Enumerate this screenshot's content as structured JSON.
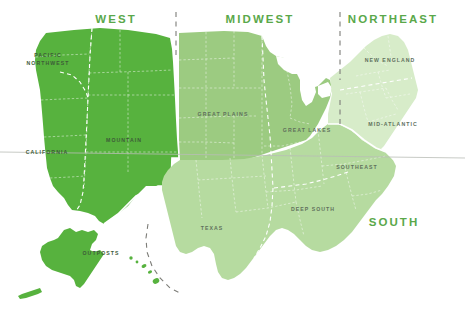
{
  "map": {
    "title_visible": false,
    "background_color": "#ffffff",
    "horizon_line_color": "#b9bcb6",
    "region_titles": [
      {
        "id": "west",
        "label": "WEST",
        "x": 116,
        "y": 23,
        "color": "#5aa84a"
      },
      {
        "id": "midwest",
        "label": "MIDWEST",
        "x": 260,
        "y": 23,
        "color": "#69b053"
      },
      {
        "id": "northeast",
        "label": "NORTHEAST",
        "x": 393,
        "y": 23,
        "color": "#7cbd63"
      },
      {
        "id": "south",
        "label": "SOUTH",
        "x": 394,
        "y": 226,
        "color": "#7cbd63"
      }
    ],
    "subregions": [
      {
        "id": "pacific-northwest",
        "label": "PACIFIC",
        "label2": "NORTHWEST",
        "x": 48,
        "y": 57,
        "tone": "dark"
      },
      {
        "id": "california",
        "label": "CALIFORNIA",
        "x": 47,
        "y": 154,
        "tone": "dark"
      },
      {
        "id": "mountain",
        "label": "MOUNTAIN",
        "x": 124,
        "y": 142,
        "tone": "dark"
      },
      {
        "id": "great-plains",
        "label": "GREAT PLAINS",
        "x": 223,
        "y": 116,
        "tone": "mid"
      },
      {
        "id": "great-lakes",
        "label": "GREAT LAKES",
        "x": 307,
        "y": 132,
        "tone": "mid"
      },
      {
        "id": "new-england",
        "label": "NEW ENGLAND",
        "x": 390,
        "y": 62,
        "tone": "light"
      },
      {
        "id": "mid-atlantic",
        "label": "MID-ATLANTIC",
        "x": 393,
        "y": 126,
        "tone": "light"
      },
      {
        "id": "southeast",
        "label": "SOUTHEAST",
        "x": 357,
        "y": 169,
        "tone": "light"
      },
      {
        "id": "deep-south",
        "label": "DEEP SOUTH",
        "x": 313,
        "y": 211,
        "tone": "mid"
      },
      {
        "id": "texas",
        "label": "TEXAS",
        "x": 212,
        "y": 230,
        "tone": "mid"
      },
      {
        "id": "outposts",
        "label": "OUTPOSTS",
        "x": 101,
        "y": 255,
        "tone": "dark"
      }
    ],
    "colors": {
      "west_fill": "#57b23e",
      "midwest_fill": "#9ccb81",
      "south_fill": "#b6dba0",
      "northeast_fill": "#d7ecc9",
      "great_lakes_fill": "#a6d08c",
      "deep_south_fill": "#aed498",
      "outposts_fill": "#57b23e",
      "divider_dash": "#7d7d78",
      "inner_dash": "#ffffff"
    }
  }
}
